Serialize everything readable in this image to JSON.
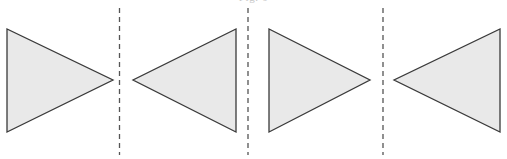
{
  "figure": {
    "caption_clipped": "Fig. 6",
    "background_color": "#ffffff",
    "width": 507,
    "height": 159,
    "shape_fill": "#e9e9e9",
    "shape_stroke": "#3a3a3a",
    "shape_stroke_width": 1.3,
    "line_color": "#555555",
    "line_width": 1.3,
    "line_dash": "5 4"
  },
  "shapes": [
    {
      "name": "triangle-1",
      "label": "Triangle 1",
      "direction": "points-right",
      "points": "7,29 7,132 113,80",
      "base_x": 7,
      "apex_x": 113,
      "apex_y": 80,
      "top_y": 29,
      "bottom_y": 132
    },
    {
      "name": "triangle-2",
      "label": "Triangle 2",
      "direction": "points-left",
      "points": "236,29 236,132 133,80",
      "base_x": 236,
      "apex_x": 133,
      "apex_y": 80,
      "top_y": 29,
      "bottom_y": 132
    },
    {
      "name": "triangle-3",
      "label": "Triangle 3",
      "direction": "points-right",
      "points": "269,29 269,132 370,80",
      "base_x": 269,
      "apex_x": 370,
      "apex_y": 80,
      "top_y": 29,
      "bottom_y": 132
    },
    {
      "name": "triangle-4",
      "label": "Triangle 4",
      "direction": "points-left",
      "points": "500,29 500,132 394,80",
      "base_x": 500,
      "apex_x": 394,
      "apex_y": 80,
      "top_y": 29,
      "bottom_y": 132
    }
  ],
  "mirror_lines": [
    {
      "name": "mirror-line-1",
      "label": "Mirror line 1",
      "x": 119.5,
      "y_top": 8,
      "y_bottom": 155
    },
    {
      "name": "mirror-line-2",
      "label": "Mirror line 2",
      "x": 248.0,
      "y_top": 8,
      "y_bottom": 155
    },
    {
      "name": "mirror-line-3",
      "label": "Mirror line 3",
      "x": 383.0,
      "y_top": 8,
      "y_bottom": 155
    }
  ]
}
